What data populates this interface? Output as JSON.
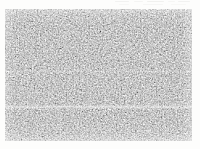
{
  "document": {
    "background_color": "#fdfdfc",
    "width": 200,
    "height": 149
  },
  "figure": {
    "kind": "micrograph",
    "alt_text": "Grayscale micrograph with uniform fine granular texture",
    "has_scale_bar": false,
    "has_caption": false,
    "has_labels": false,
    "panel": {
      "left": 5,
      "top": 9,
      "width": 187,
      "height": 132,
      "mean_gray": "#9a9a98",
      "dark_speck_color": "#2d2d2d",
      "light_speck_color": "#f2f2f0",
      "grain_scale": "fine"
    },
    "artifacts": {
      "horizontal_light_band_y": 107,
      "secondary_light_band_y": 71,
      "bleed_through_marks": "faint gray ghost marks along the top right edge"
    }
  }
}
